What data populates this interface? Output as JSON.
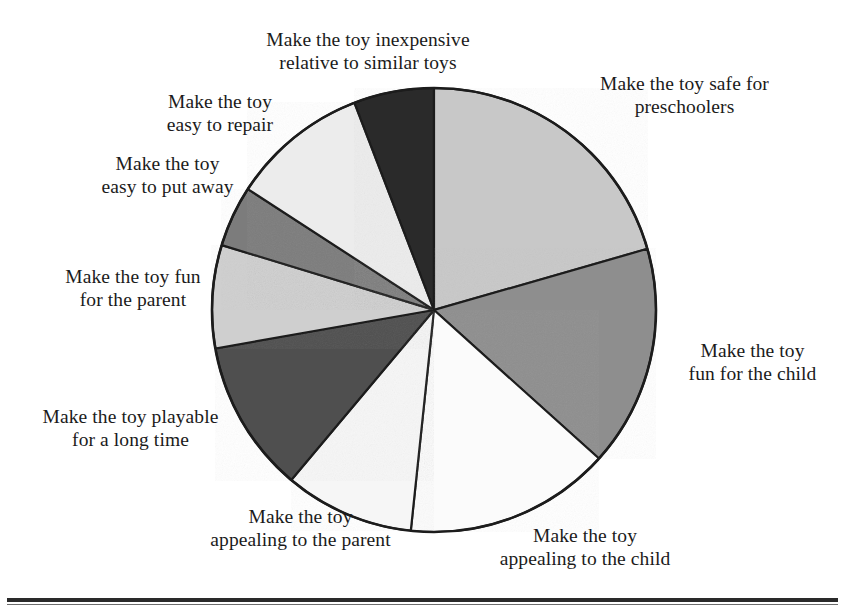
{
  "figure": {
    "background_color": "#ffffff",
    "outline_color": "#1c1c1c"
  },
  "chart_data": {
    "type": "pie",
    "title": "",
    "subtitle": "",
    "xlabel": "",
    "ylabel": "",
    "legend_position": "outside-labels",
    "grid": false,
    "start_angle_deg": 0,
    "direction": "clockwise",
    "center_px": [
      434,
      310
    ],
    "radius_px": 222,
    "categories": [
      "Make the toy safe for preschoolers",
      "Make the toy fun for the child",
      "Make the toy appealing to the child",
      "Make the toy appealing to the parent",
      "Make the toy playable for a long time",
      "Make the toy fun for the parent",
      "Make the toy easy to put away",
      "Make the toy easy to repair",
      "Make the toy inexpensive relative to similar toys"
    ],
    "values": [
      74,
      58,
      54,
      34,
      40,
      27,
      16,
      36,
      21
    ],
    "value_unit": "degrees",
    "percentages": [
      20.6,
      16.1,
      15.0,
      9.4,
      11.1,
      7.5,
      4.4,
      10.0,
      5.8
    ],
    "colors": [
      "#c8c8c8",
      "#8e8e8e",
      "#fbfbfb",
      "#f6f6f6",
      "#4f4f4f",
      "#cfcfcf",
      "#7c7c7c",
      "#ececec",
      "#2b2b2b"
    ]
  },
  "slices": [
    {
      "name": "safe-for-preschoolers",
      "start_deg": 0,
      "end_deg": 74,
      "color": "#c8c8c8",
      "label_lines": [
        "Make the toy safe for",
        "preschoolers"
      ]
    },
    {
      "name": "fun-for-the-child",
      "start_deg": 74,
      "end_deg": 132,
      "color": "#8e8e8e",
      "label_lines": [
        "Make the toy",
        "fun for the child"
      ]
    },
    {
      "name": "appealing-to-the-child",
      "start_deg": 132,
      "end_deg": 186,
      "color": "#fbfbfb",
      "label_lines": [
        "Make the toy",
        "appealing to the child"
      ]
    },
    {
      "name": "appealing-to-the-parent",
      "start_deg": 186,
      "end_deg": 220,
      "color": "#f6f6f6",
      "label_lines": [
        "Make the toy",
        "appealing to the parent"
      ]
    },
    {
      "name": "playable-for-a-long-time",
      "start_deg": 220,
      "end_deg": 260,
      "color": "#4f4f4f",
      "label_lines": [
        "Make the toy playable",
        "for a long time"
      ]
    },
    {
      "name": "fun-for-the-parent",
      "start_deg": 260,
      "end_deg": 287,
      "color": "#cfcfcf",
      "label_lines": [
        "Make the toy fun",
        "for the parent"
      ]
    },
    {
      "name": "easy-to-put-away",
      "start_deg": 287,
      "end_deg": 303,
      "color": "#7c7c7c",
      "label_lines": [
        "Make the toy",
        "easy to put away"
      ]
    },
    {
      "name": "easy-to-repair",
      "start_deg": 303,
      "end_deg": 339,
      "color": "#ececec",
      "label_lines": [
        "Make the toy",
        "easy to repair"
      ]
    },
    {
      "name": "inexpensive",
      "start_deg": 339,
      "end_deg": 360,
      "color": "#2b2b2b",
      "label_lines": [
        "Make the toy inexpensive",
        "relative to similar toys"
      ]
    }
  ],
  "labels": {
    "inexpensive": {
      "line1": "Make the toy inexpensive",
      "line2": "relative to similar toys"
    },
    "repair": {
      "line1": "Make the toy",
      "line2": "easy to repair"
    },
    "putaway": {
      "line1": "Make the toy",
      "line2": "easy to put away"
    },
    "funparent": {
      "line1": "Make the toy fun",
      "line2": "for the parent"
    },
    "playable": {
      "line1": "Make the toy playable",
      "line2": "for a long time"
    },
    "appealparent": {
      "line1": "Make the toy",
      "line2": "appealing to the parent"
    },
    "appealchild": {
      "line1": "Make the toy",
      "line2": "appealing to the child"
    },
    "funchild": {
      "line1": "Make the toy",
      "line2": "fun for the child"
    },
    "safe": {
      "line1": "Make the toy safe for",
      "line2": "preschoolers"
    }
  }
}
